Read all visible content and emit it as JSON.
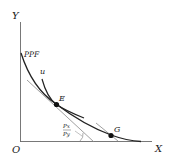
{
  "diagram": {
    "axes": {
      "y_label": "Y",
      "x_label": "X",
      "origin_label": "O"
    },
    "curves": {
      "ppf_label": "PPF",
      "indifference_label": "u"
    },
    "points": {
      "e_label": "E",
      "g_label": "G"
    },
    "price_ratio": {
      "numerator": "Px",
      "denominator": "Py"
    },
    "colors": {
      "line": "#222222",
      "tangent": "#777777",
      "background": "#ffffff"
    }
  }
}
